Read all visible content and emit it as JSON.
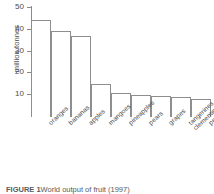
{
  "figure": {
    "caption_label": "FIGURE 1",
    "caption_text": "World output of fruit (1997)"
  },
  "chart_data": {
    "type": "bar",
    "title": "",
    "subtitle": "",
    "xlabel": "",
    "ylabel": "million tonnes",
    "categories": [
      "oranges",
      "bananas",
      "apples",
      "mangoes",
      "pineapples",
      "pears",
      "grapes",
      "tangerines, mandarins, clementines and satsumas",
      "peaches and nectarines"
    ],
    "category_lines": [
      [
        "oranges"
      ],
      [
        "bananas"
      ],
      [
        "apples"
      ],
      [
        "mangoes"
      ],
      [
        "pineapples"
      ],
      [
        "pears"
      ],
      [
        "grapes"
      ],
      [
        "tangerines, mandarins,",
        "clementines and satsumas"
      ],
      [
        "peaches and nectarines"
      ]
    ],
    "values": [
      44.5,
      39.5,
      37,
      15,
      11,
      10,
      9.5,
      9,
      8.5
    ],
    "units": "million tonnes",
    "ylim": [
      0,
      51
    ],
    "yticks": [
      10,
      20,
      30,
      40,
      50
    ],
    "ytick_labels": [
      "10",
      "20",
      "30",
      "40",
      "50"
    ],
    "grid": false,
    "legend": false,
    "legend_position": "none",
    "bar_fill_color": "#ffffff",
    "bar_edge_color": "#8e8e8e",
    "axis_color": "#8a8a8a",
    "text_color": "#4a4a4a"
  }
}
